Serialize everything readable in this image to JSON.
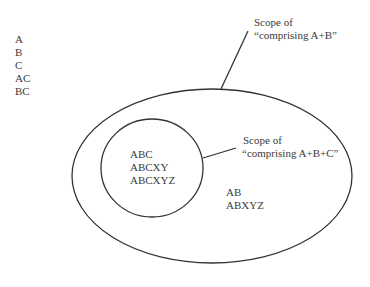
{
  "outside_list": {
    "items": [
      "A",
      "B",
      "C",
      "AC",
      "BC"
    ]
  },
  "outer_scope": {
    "label_line1": "Scope of",
    "label_line2": "“comprising A+B”",
    "items": [
      "AB",
      "ABXYZ"
    ]
  },
  "inner_scope": {
    "label_line1": "Scope of",
    "label_line2": "“comprising A+B+C”",
    "items": [
      "ABC",
      "ABCXY",
      "ABCXYZ"
    ]
  },
  "colors": {
    "stroke": "#333333",
    "text": "#3a3a3a",
    "background": "#ffffff"
  }
}
